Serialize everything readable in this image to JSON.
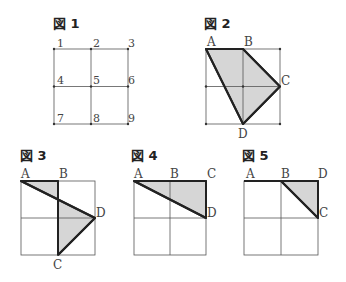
{
  "figures": [
    {
      "title": "図 1",
      "grid": {
        "x0": 54,
        "y0": 49,
        "x1": 128,
        "y1": 124
      },
      "numbers": [
        "1",
        "2",
        "3",
        "4",
        "5",
        "6",
        "7",
        "8",
        "9"
      ]
    },
    {
      "title": "図 2",
      "grid": {
        "x0": 206,
        "y0": 49,
        "x1": 280,
        "y1": 124
      },
      "labels": [
        "A",
        "B",
        "C",
        "D"
      ]
    },
    {
      "title": "図 3",
      "grid": {
        "x0": 21,
        "y0": 181,
        "x1": 95,
        "y1": 255
      },
      "labels": [
        "A",
        "B",
        "D",
        "C"
      ]
    },
    {
      "title": "図 4",
      "grid": {
        "x0": 134,
        "y0": 181,
        "x1": 206,
        "y1": 255
      },
      "labels": [
        "A",
        "B",
        "C",
        "D"
      ]
    },
    {
      "title": "図 5",
      "grid": {
        "x0": 244,
        "y0": 181,
        "x1": 318,
        "y1": 255
      },
      "labels": [
        "A",
        "B",
        "D",
        "C"
      ]
    }
  ],
  "colors": {
    "fill": "#d6d6d6",
    "stroke": "#222222",
    "grid": "#555555"
  }
}
